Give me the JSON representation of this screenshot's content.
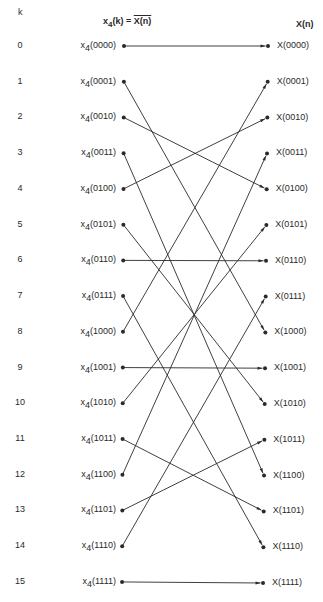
{
  "header": {
    "k_label": "k",
    "input_prefix": "x",
    "input_sub": "4",
    "input_rest": "(k) = ",
    "input_bar": "X(n)",
    "output_label": "X(n)"
  },
  "rows": [
    {
      "k": "0",
      "in_bits": "(0000)",
      "out": "X(0000)",
      "maps_to": 0
    },
    {
      "k": "1",
      "in_bits": "(0001)",
      "out": "X(0001)",
      "maps_to": 8
    },
    {
      "k": "2",
      "in_bits": "(0010)",
      "out": "X(0010)",
      "maps_to": 4
    },
    {
      "k": "3",
      "in_bits": "(0011)",
      "out": "X(0011)",
      "maps_to": 12
    },
    {
      "k": "4",
      "in_bits": "(0100)",
      "out": "X(0100)",
      "maps_to": 2
    },
    {
      "k": "5",
      "in_bits": "(0101)",
      "out": "X(0101)",
      "maps_to": 10
    },
    {
      "k": "6",
      "in_bits": "(0110)",
      "out": "X(0110)",
      "maps_to": 6
    },
    {
      "k": "7",
      "in_bits": "(0111)",
      "out": "X(0111)",
      "maps_to": 14
    },
    {
      "k": "8",
      "in_bits": "(1000)",
      "out": "X(1000)",
      "maps_to": 1
    },
    {
      "k": "9",
      "in_bits": "(1001)",
      "out": "X(1001)",
      "maps_to": 9
    },
    {
      "k": "10",
      "in_bits": "(1010)",
      "out": "X(1010)",
      "maps_to": 5
    },
    {
      "k": "11",
      "in_bits": "(1011)",
      "out": "X(1011)",
      "maps_to": 13
    },
    {
      "k": "12",
      "in_bits": "(1100)",
      "out": "X(1100)",
      "maps_to": 3
    },
    {
      "k": "13",
      "in_bits": "(1101)",
      "out": "X(1101)",
      "maps_to": 11
    },
    {
      "k": "14",
      "in_bits": "(1110)",
      "out": "X(1110)",
      "maps_to": 7
    },
    {
      "k": "15",
      "in_bits": "(1111)",
      "out": "X(1111)",
      "maps_to": 15
    }
  ],
  "style": {
    "line_color": "#2a2a2a",
    "background": "#ffffff"
  }
}
